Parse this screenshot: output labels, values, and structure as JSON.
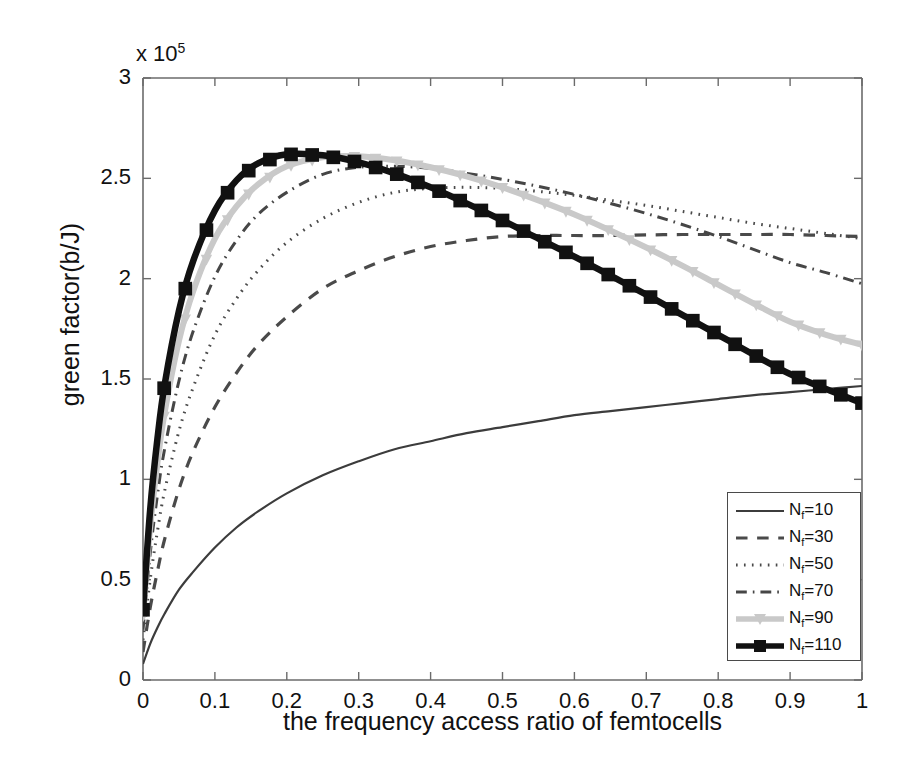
{
  "chart_data": {
    "type": "line",
    "title": "",
    "xlabel": "the frequency access ratio of femtocells",
    "ylabel": "green factor(b/J)",
    "y_exponent_prefix": "x 10",
    "y_exponent": "5",
    "xlim": [
      0,
      1
    ],
    "ylim": [
      0,
      300000
    ],
    "grid": false,
    "legend_position": "lower-right",
    "xticks": [
      "0",
      "0.1",
      "0.2",
      "0.3",
      "0.4",
      "0.5",
      "0.6",
      "0.7",
      "0.8",
      "0.9",
      "1"
    ],
    "xtick_values": [
      0,
      0.1,
      0.2,
      0.3,
      0.4,
      0.5,
      0.6,
      0.7,
      0.8,
      0.9,
      1
    ],
    "yticks": [
      "0",
      "0.5",
      "1",
      "1.5",
      "2",
      "2.5",
      "3"
    ],
    "ytick_values": [
      0,
      50000,
      100000,
      150000,
      200000,
      250000,
      300000
    ],
    "x": [
      0,
      0.01,
      0.02,
      0.03,
      0.05,
      0.07,
      0.1,
      0.13,
      0.16,
      0.2,
      0.25,
      0.3,
      0.35,
      0.4,
      0.45,
      0.5,
      0.55,
      0.6,
      0.65,
      0.7,
      0.75,
      0.8,
      0.85,
      0.9,
      0.95,
      1.0
    ],
    "series": [
      {
        "name": "Nf=10",
        "label_base": "N",
        "label_sub": "f",
        "label_tail": "=10",
        "style": "solid",
        "color": "#3c3c3c",
        "width": 2.2,
        "marker": "none",
        "values": [
          8000,
          18000,
          26000,
          33000,
          45000,
          54000,
          66000,
          76000,
          84000,
          93000,
          102000,
          109000,
          115000,
          119000,
          123000,
          126000,
          129000,
          132000,
          134000,
          136000,
          138000,
          140000,
          142000,
          143500,
          145000,
          146500
        ]
      },
      {
        "name": "Nf=30",
        "label_base": "N",
        "label_sub": "f",
        "label_tail": "=30",
        "style": "dashed",
        "color": "#4a4a4a",
        "width": 3.2,
        "marker": "none",
        "values": [
          14000,
          36000,
          54000,
          70000,
          95000,
          114000,
          136000,
          153000,
          167000,
          181000,
          195000,
          204000,
          211000,
          216000,
          219000,
          221000,
          221500,
          221500,
          221500,
          221800,
          222000,
          222000,
          222000,
          222000,
          221500,
          221000
        ]
      },
      {
        "name": "Nf=50",
        "label_base": "N",
        "label_sub": "f",
        "label_tail": "=50",
        "style": "dotted",
        "color": "#4a4a4a",
        "width": 3.0,
        "marker": "none",
        "values": [
          20000,
          50000,
          74000,
          94000,
          124000,
          146000,
          172000,
          190000,
          204000,
          218000,
          230000,
          238000,
          243000,
          245000,
          245500,
          245000,
          243500,
          241500,
          239000,
          236500,
          233500,
          230500,
          227500,
          225000,
          222500,
          220000
        ]
      },
      {
        "name": "Nf=70",
        "label_base": "N",
        "label_sub": "f",
        "label_tail": "=70",
        "style": "dashdot",
        "color": "#464646",
        "width": 3.0,
        "marker": "none",
        "values": [
          25000,
          63000,
          92000,
          115000,
          149000,
          174000,
          201000,
          219000,
          232000,
          243000,
          252000,
          255500,
          256000,
          255000,
          252500,
          249500,
          246000,
          242000,
          237500,
          232500,
          227000,
          221000,
          214500,
          208000,
          203000,
          197500
        ]
      },
      {
        "name": "Nf=90",
        "label_base": "N",
        "label_sub": "f",
        "label_tail": "=90",
        "style": "solid",
        "color": "#c9c9c9",
        "width": 6.0,
        "marker": "triangle-down",
        "values": [
          32000,
          76000,
          108000,
          133000,
          169000,
          194000,
          220000,
          236000,
          247000,
          256000,
          260500,
          261000,
          259000,
          255500,
          251000,
          245500,
          239000,
          232000,
          224000,
          215500,
          206500,
          197000,
          187500,
          178500,
          172000,
          167000
        ]
      },
      {
        "name": "Nf=110",
        "label_base": "N",
        "label_sub": "f",
        "label_tail": "=110",
        "style": "solid",
        "color": "#111111",
        "width": 6.5,
        "marker": "square",
        "values": [
          35000,
          85000,
          120000,
          147000,
          184000,
          209000,
          234000,
          249000,
          257500,
          262000,
          261500,
          258000,
          252500,
          245500,
          237500,
          229000,
          220000,
          211000,
          201500,
          192000,
          182000,
          172000,
          162000,
          152500,
          145000,
          138000
        ]
      }
    ]
  }
}
